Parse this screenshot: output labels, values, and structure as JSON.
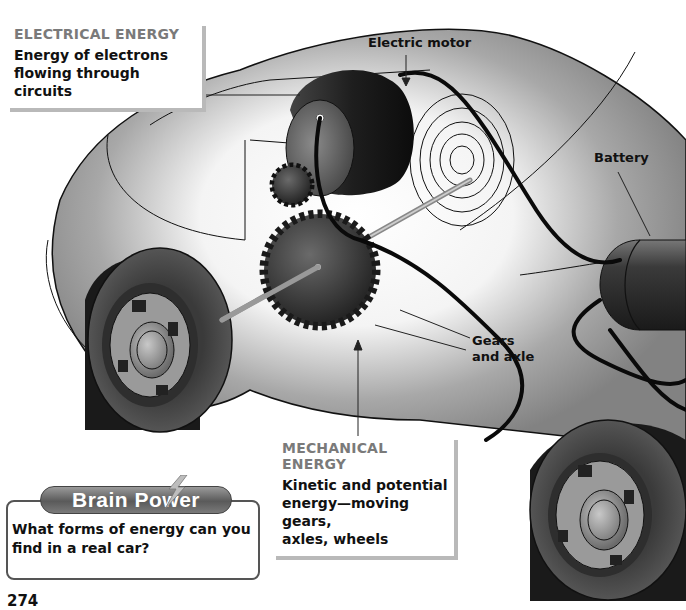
{
  "diagram": {
    "callouts": {
      "electrical": {
        "heading": "ELECTRICAL ENERGY",
        "body_line1": "Energy of electrons",
        "body_line2": "flowing through circuits"
      },
      "mechanical": {
        "heading": "MECHANICAL ENERGY",
        "body_line1": "Kinetic and potential",
        "body_line2": "energy—moving gears,",
        "body_line3": "axles, wheels"
      }
    },
    "labels": {
      "motor": "Electric motor",
      "battery": "Battery",
      "gears_line1": "Gears",
      "gears_line2": "and axle"
    },
    "components": [
      "electric-motor",
      "battery",
      "small-gear",
      "large-gear",
      "axle",
      "wires",
      "magnetic-field",
      "front-wheel",
      "rear-wheel",
      "car-body"
    ]
  },
  "brain_power": {
    "title": "Brain Power",
    "question_line1": "What forms of energy can you",
    "question_line2": "find in a real car?"
  },
  "page": {
    "number": "274"
  },
  "colors": {
    "car_body": "#8a8a8a",
    "heading_gray": "#7a7a7a",
    "motor_dark": "#2a2a2a",
    "gear_dark": "#3a3a3a",
    "outline": "#111111"
  }
}
